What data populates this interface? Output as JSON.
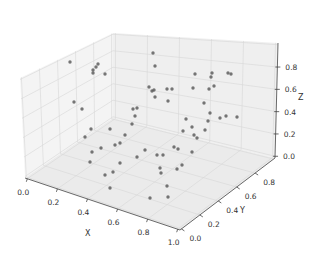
{
  "chart_data": {
    "type": "scatter",
    "subtype": "3d-scatter",
    "title": "",
    "xlabel": "X",
    "ylabel": "Y",
    "zlabel": "Z",
    "xlim": [
      0,
      1
    ],
    "ylim": [
      0,
      1
    ],
    "zlim": [
      0,
      1
    ],
    "grid": true,
    "legend": null,
    "x_ticks": [
      "0.0",
      "0.2",
      "0.4",
      "0.6",
      "0.8",
      "1.0"
    ],
    "y_ticks": [
      "0.0",
      "0.2",
      "0.4",
      "0.6",
      "0.8"
    ],
    "z_ticks": [
      "0.0",
      "0.2",
      "0.4",
      "0.6",
      "0.8"
    ],
    "marker_color": "#555555",
    "pane_color": "#f2f2f2",
    "grid_color": "#d9d9d9",
    "points_screen": [
      [
        70,
        62
      ],
      [
        93,
        73
      ],
      [
        96,
        67
      ],
      [
        98,
        64
      ],
      [
        93,
        70
      ],
      [
        105,
        74
      ],
      [
        74,
        102
      ],
      [
        85,
        137
      ],
      [
        91,
        129
      ],
      [
        110,
        129
      ],
      [
        82,
        109
      ],
      [
        133,
        109
      ],
      [
        137,
        108
      ],
      [
        135,
        116
      ],
      [
        132,
        124
      ],
      [
        153,
        53
      ],
      [
        155,
        66
      ],
      [
        149,
        87
      ],
      [
        155,
        97
      ],
      [
        152,
        91
      ],
      [
        172,
        89
      ],
      [
        167,
        89
      ],
      [
        168,
        101
      ],
      [
        154,
        90
      ],
      [
        195,
        74
      ],
      [
        211,
        77
      ],
      [
        212,
        73
      ],
      [
        193,
        88
      ],
      [
        209,
        89
      ],
      [
        214,
        86
      ],
      [
        204,
        103
      ],
      [
        210,
        113
      ],
      [
        186,
        119
      ],
      [
        192,
        127
      ],
      [
        208,
        121
      ],
      [
        220,
        118
      ],
      [
        228,
        73
      ],
      [
        231,
        74
      ],
      [
        226,
        116
      ],
      [
        237,
        117
      ],
      [
        205,
        130
      ],
      [
        194,
        135
      ],
      [
        183,
        131
      ],
      [
        174,
        147
      ],
      [
        178,
        149
      ],
      [
        197,
        138
      ],
      [
        125,
        135
      ],
      [
        115,
        145
      ],
      [
        92,
        152
      ],
      [
        101,
        148
      ],
      [
        120,
        143
      ],
      [
        145,
        150
      ],
      [
        137,
        157
      ],
      [
        120,
        163
      ],
      [
        90,
        162
      ],
      [
        105,
        175
      ],
      [
        113,
        172
      ],
      [
        157,
        155
      ],
      [
        163,
        155
      ],
      [
        161,
        173
      ],
      [
        182,
        165
      ],
      [
        192,
        152
      ],
      [
        177,
        169
      ],
      [
        167,
        186
      ],
      [
        150,
        198
      ],
      [
        168,
        197
      ],
      [
        110,
        188
      ],
      [
        160,
        168
      ]
    ],
    "approx_points_xyz_note": "Values uniformly scattered in [0,1]^3 (approx. 60 points); screen positions recorded above"
  }
}
